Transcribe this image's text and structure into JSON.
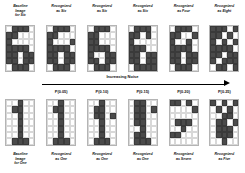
{
  "figure": {
    "grid": {
      "cols": 5,
      "rows": 7
    },
    "colors": {
      "pixel_on": "#4a4a4a",
      "pixel_off": "#ffffff",
      "grid_line": "#d8d8d8",
      "text": "#111111",
      "arrow": "#000000"
    }
  },
  "noise_axis": {
    "title": "Increasing Noise",
    "arrow": "right-arrow",
    "levels": [
      "",
      "P(0.05)",
      "P(0.10)",
      "P(0.15)",
      "P(0.20)",
      "P(0.25)"
    ]
  },
  "top_row": {
    "labels": [
      {
        "l1": "Baseline",
        "l2": "Image",
        "l3": "for Six"
      },
      {
        "l1": "Recognized",
        "l2": "as Six",
        "l3": ""
      },
      {
        "l1": "Recognized",
        "l2": "as Six",
        "l3": ""
      },
      {
        "l1": "Recognized",
        "l2": "as Six",
        "l3": ""
      },
      {
        "l1": "Recognized",
        "l2": "as Four",
        "l3": ""
      },
      {
        "l1": "Recognized",
        "l2": "as Eight",
        "l3": ""
      }
    ],
    "grids": [
      [
        [
          0,
          1,
          1,
          1,
          0
        ],
        [
          1,
          1,
          0,
          0,
          0
        ],
        [
          1,
          0,
          0,
          0,
          0
        ],
        [
          1,
          1,
          1,
          1,
          0
        ],
        [
          1,
          1,
          0,
          1,
          1
        ],
        [
          1,
          1,
          0,
          1,
          1
        ],
        [
          0,
          1,
          1,
          1,
          0
        ]
      ],
      [
        [
          0,
          1,
          1,
          1,
          0
        ],
        [
          1,
          1,
          0,
          0,
          0
        ],
        [
          1,
          0,
          0,
          0,
          1
        ],
        [
          1,
          1,
          1,
          1,
          0
        ],
        [
          1,
          1,
          0,
          1,
          1
        ],
        [
          1,
          1,
          0,
          1,
          1
        ],
        [
          0,
          1,
          1,
          1,
          0
        ]
      ],
      [
        [
          0,
          1,
          1,
          1,
          0
        ],
        [
          1,
          1,
          0,
          0,
          0
        ],
        [
          1,
          1,
          0,
          0,
          0
        ],
        [
          1,
          1,
          1,
          1,
          0
        ],
        [
          1,
          0,
          0,
          1,
          1
        ],
        [
          1,
          1,
          0,
          1,
          1
        ],
        [
          0,
          1,
          1,
          1,
          0
        ]
      ],
      [
        [
          0,
          1,
          1,
          1,
          0
        ],
        [
          1,
          1,
          0,
          1,
          0
        ],
        [
          1,
          0,
          0,
          0,
          0
        ],
        [
          1,
          1,
          1,
          0,
          0
        ],
        [
          1,
          1,
          0,
          1,
          1
        ],
        [
          1,
          1,
          0,
          1,
          1
        ],
        [
          0,
          1,
          1,
          1,
          1
        ]
      ],
      [
        [
          0,
          1,
          1,
          1,
          0
        ],
        [
          1,
          1,
          0,
          0,
          1
        ],
        [
          1,
          0,
          0,
          1,
          0
        ],
        [
          1,
          1,
          1,
          1,
          0
        ],
        [
          1,
          1,
          0,
          1,
          1
        ],
        [
          1,
          1,
          0,
          1,
          1
        ],
        [
          0,
          1,
          1,
          1,
          0
        ]
      ],
      [
        [
          1,
          1,
          1,
          0,
          1
        ],
        [
          1,
          1,
          0,
          1,
          0
        ],
        [
          1,
          0,
          1,
          0,
          1
        ],
        [
          1,
          1,
          1,
          1,
          0
        ],
        [
          1,
          1,
          0,
          1,
          1
        ],
        [
          1,
          0,
          1,
          1,
          1
        ],
        [
          0,
          1,
          1,
          0,
          1
        ]
      ]
    ]
  },
  "bottom_row": {
    "labels": [
      {
        "l1": "Baseline",
        "l2": "Image",
        "l3": "for One"
      },
      {
        "l1": "Recognized",
        "l2": "as One",
        "l3": ""
      },
      {
        "l1": "Recognized",
        "l2": "as One",
        "l3": ""
      },
      {
        "l1": "Recognized",
        "l2": "as One",
        "l3": ""
      },
      {
        "l1": "Recognized",
        "l2": "as Seven",
        "l3": ""
      },
      {
        "l1": "Recognized",
        "l2": "as Five",
        "l3": ""
      }
    ],
    "grids": [
      [
        [
          0,
          0,
          1,
          0,
          0
        ],
        [
          0,
          1,
          1,
          0,
          0
        ],
        [
          0,
          0,
          1,
          0,
          0
        ],
        [
          0,
          0,
          1,
          0,
          0
        ],
        [
          0,
          0,
          1,
          0,
          0
        ],
        [
          0,
          0,
          1,
          0,
          0
        ],
        [
          0,
          1,
          1,
          1,
          0
        ]
      ],
      [
        [
          0,
          0,
          1,
          0,
          0
        ],
        [
          0,
          1,
          1,
          0,
          0
        ],
        [
          0,
          0,
          1,
          0,
          0
        ],
        [
          0,
          0,
          1,
          0,
          0
        ],
        [
          0,
          0,
          1,
          0,
          0
        ],
        [
          0,
          0,
          1,
          0,
          0
        ],
        [
          0,
          1,
          1,
          1,
          0
        ]
      ],
      [
        [
          0,
          0,
          1,
          0,
          0
        ],
        [
          0,
          1,
          1,
          0,
          0
        ],
        [
          0,
          1,
          1,
          0,
          1
        ],
        [
          0,
          0,
          1,
          0,
          0
        ],
        [
          0,
          0,
          1,
          0,
          0
        ],
        [
          0,
          0,
          1,
          0,
          0
        ],
        [
          0,
          1,
          1,
          1,
          0
        ]
      ],
      [
        [
          0,
          1,
          1,
          0,
          0
        ],
        [
          0,
          1,
          1,
          0,
          1
        ],
        [
          0,
          1,
          1,
          0,
          0
        ],
        [
          0,
          1,
          1,
          0,
          0
        ],
        [
          0,
          0,
          1,
          0,
          0
        ],
        [
          0,
          1,
          1,
          0,
          0
        ],
        [
          0,
          1,
          1,
          1,
          0
        ]
      ],
      [
        [
          1,
          1,
          0,
          1,
          0
        ],
        [
          0,
          0,
          0,
          0,
          1
        ],
        [
          0,
          0,
          0,
          0,
          0
        ],
        [
          0,
          1,
          1,
          1,
          0
        ],
        [
          0,
          0,
          1,
          0,
          0
        ],
        [
          1,
          1,
          0,
          0,
          0
        ],
        [
          0,
          0,
          0,
          0,
          0
        ]
      ],
      [
        [
          1,
          0,
          1,
          0,
          1
        ],
        [
          0,
          1,
          0,
          1,
          0
        ],
        [
          0,
          0,
          1,
          1,
          0
        ],
        [
          0,
          1,
          1,
          0,
          1
        ],
        [
          0,
          1,
          1,
          1,
          0
        ],
        [
          0,
          1,
          1,
          1,
          0
        ],
        [
          0,
          0,
          1,
          0,
          0
        ]
      ]
    ]
  }
}
